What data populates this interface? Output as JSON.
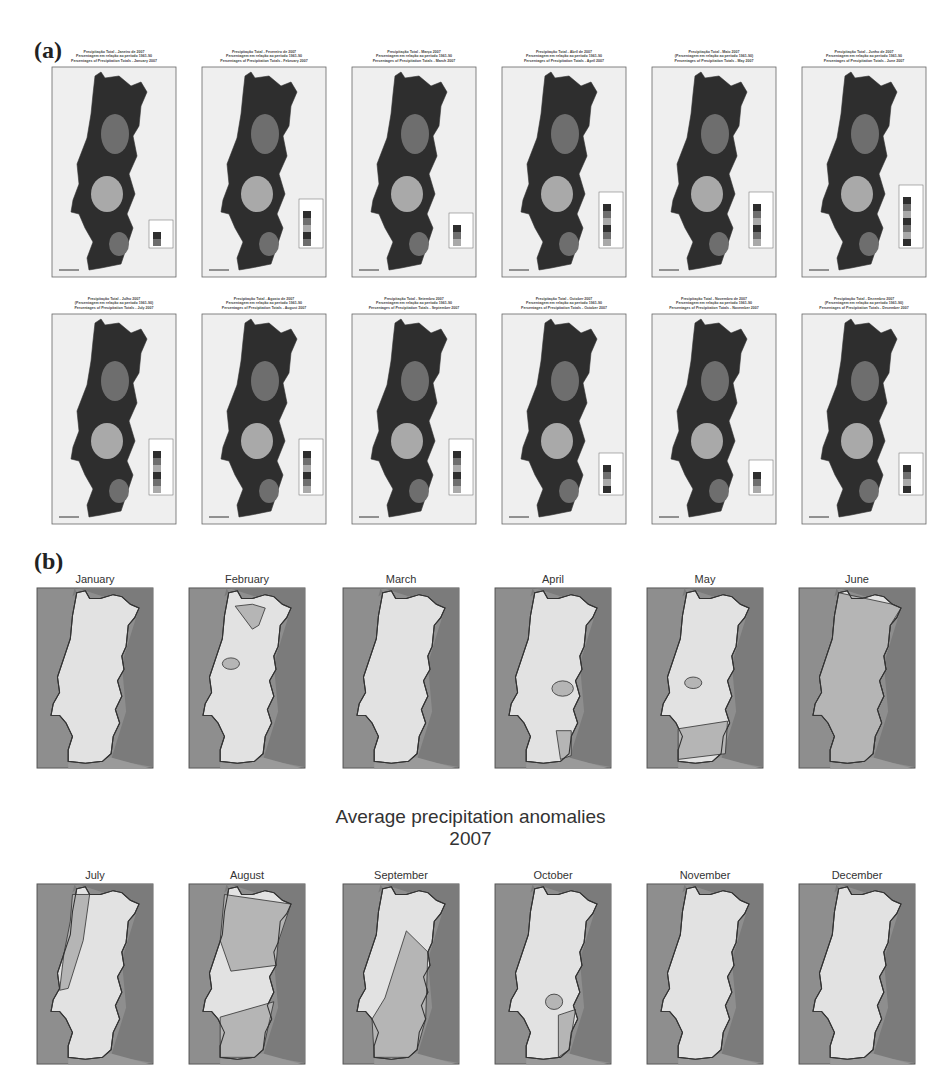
{
  "panel_a": {
    "label": "(a)",
    "maps": [
      {
        "month": "January",
        "t1": "Precipitação Total - Janeiro de 2007",
        "t2": "Percentagem em relação ao período 1961-90",
        "t3": "Percentages of Precipitation Totals - January 2007",
        "legend": [
          "(%)",
          "80.0",
          "20.0"
        ]
      },
      {
        "month": "February",
        "t1": "Precipitação Total - Fevereiro de 2007",
        "t2": "Percentagem em relação ao período 1961-90",
        "t3": "Percentages of Precipitation Totals - February 2007",
        "legend": [
          "(%)",
          "130.0",
          "110.0",
          "90.0",
          "70.0",
          "50.0"
        ]
      },
      {
        "month": "March",
        "t1": "Precipitação Total - Março 2007",
        "t2": "Percentagem em relação ao período 1961-90",
        "t3": "Percentages of Precipitation Totals - March 2007",
        "legend": [
          "(%)",
          "70.0",
          "50.0",
          "30.0"
        ]
      },
      {
        "month": "April",
        "t1": "Precipitação Total - Abril de 2007",
        "t2": "Percentagem em relação ao período 1961-90",
        "t3": "Percentages of Precipitation Totals - April 2007",
        "legend": [
          "(%)",
          "140.0",
          "120.0",
          "100.0",
          "80.0",
          "60.0",
          "40.0"
        ]
      },
      {
        "month": "May",
        "t1": "Precipitação Total - Maio 2007",
        "t2": "(Percentagem em relação ao período 1961-90)",
        "t3": "Percentages of Precipitation Totals - May 2007",
        "legend": [
          "(%)",
          "140.0",
          "120.0",
          "100.0",
          "80.0",
          "60.0",
          "40.0"
        ]
      },
      {
        "month": "June",
        "t1": "Precipitação Total - Junho de 2007",
        "t2": "Percentagem em relação ao período 1961-90",
        "t3": "Percentages of Precipitation Totals - June 2007",
        "legend": [
          "(%)",
          "200.0",
          "160.0",
          "140.0",
          "120.0",
          "100.0",
          "80.0",
          "60.0"
        ]
      },
      {
        "month": "July",
        "t1": "Precipitação Total - Julho 2007",
        "t2": "(Percentagem em relação ao período 1961-90)",
        "t3": "Percentages of Precipitation Totals - July 2007",
        "legend": [
          "(%)",
          "150.0",
          "130.0",
          "110.0",
          "90.0",
          "70.0",
          "50.0"
        ]
      },
      {
        "month": "August",
        "t1": "Precipitação Total - Agosto de 2007",
        "t2": "Percentagem em relação ao período 1961-90",
        "t3": "Percentages of Precipitation Totals - August 2007",
        "legend": [
          "(%)",
          "400.0",
          "250.0",
          "150.0",
          "100.0",
          "80.0",
          "30.0"
        ]
      },
      {
        "month": "September",
        "t1": "Precipitação Total - Setembro 2007",
        "t2": "Percentagem em relação ao período 1961-90",
        "t3": "Percentages of Precipitation Totals - September 2007",
        "legend": [
          "(%)",
          "300.0",
          "250.0",
          "200.0",
          "150.0",
          "100.0",
          "50.0"
        ]
      },
      {
        "month": "October",
        "t1": "Precipitação Total - October 2007",
        "t2": "Percentagem em relação ao período 1961-90",
        "t3": "Percentages of Precipitation Totals - October 2007",
        "legend": [
          "(%)",
          "100.0",
          "80.0",
          "60.0",
          "40.0"
        ]
      },
      {
        "month": "November",
        "t1": "Precipitação Total - Novembro de 2007",
        "t2": "Percentagem em relação ao período 1961-90",
        "t3": "Percentages of Precipitation Totals - November 2007",
        "legend": [
          "(%)",
          "90.0",
          "60.0",
          "40.0"
        ]
      },
      {
        "month": "December",
        "t1": "Precipitação Total - Dezembro 2007",
        "t2": "(Percentagem em relação ao período 1961-90)",
        "t3": "Percentages of Precipitation Totals - December 2007",
        "legend": [
          "(%)",
          "80.0",
          "60.0",
          "40.0",
          "20.0"
        ]
      }
    ]
  },
  "panel_b": {
    "label": "(b)",
    "center_title_line1": "Average precipitation anomalies",
    "center_title_line2": "2007",
    "months": [
      "January",
      "February",
      "March",
      "April",
      "May",
      "June",
      "July",
      "August",
      "September",
      "October",
      "November",
      "December"
    ]
  },
  "colors": {
    "sea": "#8e8e8e",
    "spain": "#7b7b7b",
    "land_light": "#e2e2e2",
    "land_mid": "#b5b5b5",
    "border": "#333333",
    "a_dark": "#2e2e2e",
    "a_mid": "#6e6e6e",
    "a_light": "#a9a9a9",
    "a_bg": "#e8e8e8"
  }
}
